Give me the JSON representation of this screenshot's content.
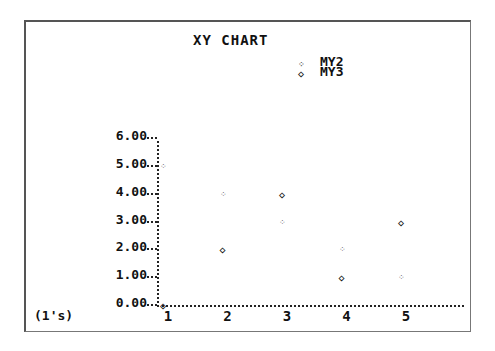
{
  "chart_data": {
    "type": "scatter",
    "title": "XY CHART",
    "xlabel": "(1's)",
    "ylabel": "",
    "x": [
      1,
      2,
      3,
      4,
      5
    ],
    "x_tick_labels": [
      "1",
      "2",
      "3",
      "4",
      "5"
    ],
    "y_tick_labels": [
      "0.00",
      "1.00",
      "2.00",
      "3.00",
      "4.00",
      "5.00",
      "6.00"
    ],
    "ylim": [
      0,
      6
    ],
    "xlim": [
      1,
      5.5
    ],
    "grid": false,
    "legend_position": "top-right",
    "series": [
      {
        "name": "MY2",
        "marker": "dotted-x",
        "values": [
          5,
          4,
          3,
          2,
          1
        ]
      },
      {
        "name": "MY3",
        "marker": "diamond",
        "values": [
          0,
          2,
          4,
          1,
          3
        ]
      }
    ]
  },
  "legend": {
    "items": [
      {
        "label": "MY2",
        "symbol": "⁘"
      },
      {
        "label": "MY3",
        "symbol": "◇"
      }
    ]
  }
}
